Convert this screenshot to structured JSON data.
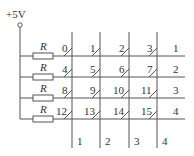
{
  "supply": {
    "label": "+5V"
  },
  "resistor_label": "R",
  "keys": [
    [
      "0",
      "1",
      "2",
      "3"
    ],
    [
      "4",
      "5",
      "6",
      "7"
    ],
    [
      "8",
      "9",
      "10",
      "11"
    ],
    [
      "12",
      "13",
      "14",
      "15"
    ]
  ],
  "row_labels": [
    "1",
    "2",
    "3",
    "4"
  ],
  "column_labels": [
    "1",
    "2",
    "3",
    "4"
  ]
}
